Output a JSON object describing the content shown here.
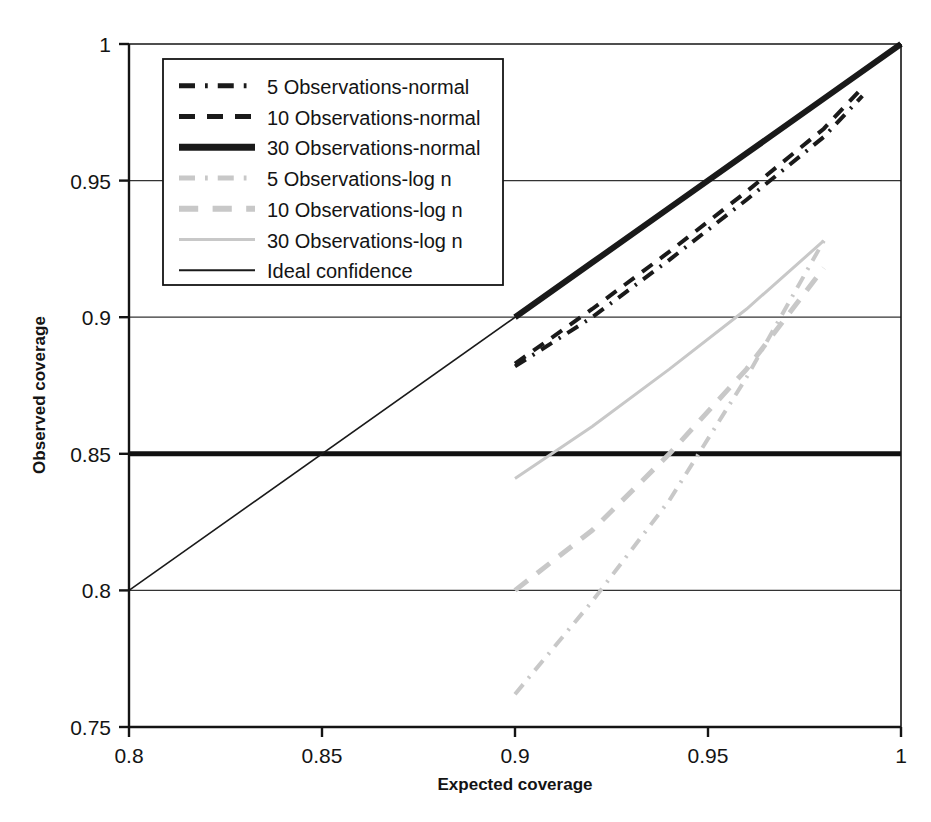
{
  "chart_data": {
    "type": "line",
    "title": "",
    "xlabel": "Expected coverage",
    "ylabel": "Observed coverage",
    "xlim": [
      0.8,
      1.0
    ],
    "ylim": [
      0.75,
      1.0
    ],
    "xticks": [
      "0.8",
      "0.85",
      "0.9",
      "0.95",
      "1"
    ],
    "xtick_values": [
      0.8,
      0.85,
      0.9,
      0.95,
      1.0
    ],
    "yticks": [
      "0.75",
      "0.8",
      "0.85",
      "0.9",
      "0.95",
      "1"
    ],
    "ytick_values": [
      0.75,
      0.8,
      0.85,
      0.9,
      0.95,
      1.0
    ],
    "grid": true,
    "grid_axis": "y",
    "legend_position": "upper-left",
    "series": [
      {
        "name": "5 Observations-normal",
        "style": "dash-dot",
        "color": "#1a1a1a",
        "width": 4,
        "x": [
          0.9,
          0.92,
          0.94,
          0.96,
          0.98,
          0.99
        ],
        "y": [
          0.882,
          0.9,
          0.921,
          0.943,
          0.966,
          0.981
        ]
      },
      {
        "name": "10 Observations-normal",
        "style": "dashed",
        "color": "#1a1a1a",
        "width": 4,
        "x": [
          0.9,
          0.92,
          0.94,
          0.96,
          0.98,
          0.99
        ],
        "y": [
          0.883,
          0.903,
          0.924,
          0.946,
          0.969,
          0.984
        ]
      },
      {
        "name": "30 Observations-normal",
        "style": "solid",
        "color": "#1a1a1a",
        "width": 6,
        "x": [
          0.9,
          0.92,
          0.94,
          0.96,
          0.98,
          1.0
        ],
        "y": [
          0.9,
          0.92,
          0.94,
          0.96,
          0.98,
          1.0
        ]
      },
      {
        "name": "5 Observations-log n",
        "style": "dash-dot",
        "color": "#c8c8c8",
        "width": 4,
        "x": [
          0.9,
          0.92,
          0.94,
          0.96,
          0.98
        ],
        "y": [
          0.762,
          0.796,
          0.833,
          0.878,
          0.928
        ]
      },
      {
        "name": "10 Observations-log n",
        "style": "dashed",
        "color": "#c8c8c8",
        "width": 5,
        "x": [
          0.9,
          0.92,
          0.94,
          0.96,
          0.98
        ],
        "y": [
          0.8,
          0.822,
          0.85,
          0.881,
          0.918
        ]
      },
      {
        "name": "30 Observations-log n",
        "style": "solid",
        "color": "#c8c8c8",
        "width": 3,
        "x": [
          0.9,
          0.92,
          0.94,
          0.96,
          0.98
        ],
        "y": [
          0.841,
          0.86,
          0.881,
          0.903,
          0.928
        ]
      },
      {
        "name": "Ideal confidence",
        "style": "solid",
        "color": "#1a1a1a",
        "width": 1.6,
        "x": [
          0.8,
          1.0
        ],
        "y": [
          0.8,
          1.0
        ]
      }
    ]
  },
  "legend": {
    "items": [
      {
        "label": "5 Observations-normal",
        "style": "dash-dot",
        "color": "#1a1a1a",
        "width": 5
      },
      {
        "label": "10 Observations-normal",
        "style": "dashed",
        "color": "#1a1a1a",
        "width": 5
      },
      {
        "label": "30 Observations-normal",
        "style": "solid",
        "color": "#1a1a1a",
        "width": 7
      },
      {
        "label": "5 Observations-log n",
        "style": "dash-dot",
        "color": "#c8c8c8",
        "width": 5
      },
      {
        "label": "10 Observations-log n",
        "style": "dashed",
        "color": "#c8c8c8",
        "width": 6
      },
      {
        "label": "30 Observations-log n",
        "style": "solid",
        "color": "#c8c8c8",
        "width": 3
      },
      {
        "label": "Ideal confidence",
        "style": "solid",
        "color": "#1a1a1a",
        "width": 2
      }
    ]
  },
  "colors": {
    "axis": "#141414",
    "gridline": "#333333",
    "emphasis_gridline": "#111111",
    "series_dark": "#1a1a1a",
    "series_light": "#c8c8c8",
    "background": "#ffffff"
  }
}
